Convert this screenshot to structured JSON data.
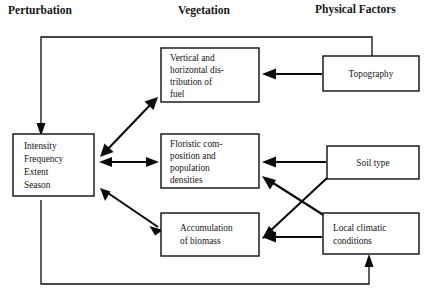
{
  "figure": {
    "type": "conceptual-flow-diagram",
    "title": "",
    "background_color": "#ffffff",
    "line_color": "#0b0b0b"
  },
  "headings": [
    {
      "id": "perturbation",
      "label": "Perturbation",
      "x": 8,
      "y": 14
    },
    {
      "id": "vegetation",
      "label": "Vegetation",
      "x": 178,
      "y": 14
    },
    {
      "id": "physical_factors",
      "label": "Physical Factors",
      "x": 315,
      "y": 13
    }
  ],
  "boxes": [
    {
      "id": "perturbation-box",
      "name": "perturbation-attributes-box",
      "column": "Perturbation",
      "x": 13,
      "y": 134,
      "width": 81,
      "height": 62,
      "align": "left",
      "lines": [
        "Intensity",
        "Frequency",
        "Extent",
        "Season"
      ]
    },
    {
      "id": "fuel-box",
      "name": "fuel-distribution-box",
      "column": "Vegetation",
      "x": 161,
      "y": 48,
      "width": 98,
      "height": 54,
      "align": "left",
      "lines": [
        "Vertical and",
        "horizontal dis-",
        "tribution of",
        "fuel"
      ]
    },
    {
      "id": "floristic-box",
      "name": "floristic-composition-box",
      "column": "Vegetation",
      "x": 161,
      "y": 134,
      "width": 98,
      "height": 54,
      "align": "left",
      "lines": [
        "Floristic com-",
        "position and",
        "population",
        "densities"
      ]
    },
    {
      "id": "biomass-box",
      "name": "biomass-accumulation-box",
      "column": "Vegetation",
      "x": 161,
      "y": 213,
      "width": 98,
      "height": 43,
      "align": "center",
      "lines": [
        "Accumulation",
        "of  biomass"
      ]
    },
    {
      "id": "topography-box",
      "name": "topography-box",
      "column": "Physical Factors",
      "x": 323,
      "y": 56,
      "width": 96,
      "height": 35,
      "align": "center",
      "lines": [
        "Topography"
      ]
    },
    {
      "id": "soiltype-box",
      "name": "soil-type-box",
      "column": "Physical Factors",
      "x": 327,
      "y": 146,
      "width": 92,
      "height": 33,
      "align": "center",
      "lines": [
        "Soil type"
      ]
    },
    {
      "id": "climate-box",
      "name": "local-climatic-conditions-box",
      "column": "Physical Factors",
      "x": 323,
      "y": 213,
      "width": 96,
      "height": 41,
      "align": "left",
      "lines": [
        "Local climatic",
        "conditions"
      ]
    }
  ],
  "connectors": [
    {
      "id": "c1",
      "name": "connector-perturbation-fuel",
      "from": "perturbation-box",
      "to": "fuel-box",
      "kind": "diagonal",
      "arrows": "both",
      "points": "102,155 156,99"
    },
    {
      "id": "c2",
      "name": "connector-perturbation-floristic",
      "from": "perturbation-box",
      "to": "floristic-box",
      "kind": "horizontal",
      "arrows": "both",
      "points": "99,162 158,162"
    },
    {
      "id": "c3",
      "name": "connector-perturbation-biomass",
      "from": "perturbation-box",
      "to": "biomass-box",
      "kind": "diagonal",
      "arrows": "both",
      "points": "101,188 162,229"
    },
    {
      "id": "c4",
      "name": "connector-topography-fuel",
      "from": "topography-box",
      "to": "fuel-box",
      "kind": "horizontal",
      "arrows": "to",
      "points": "322,74 263,74"
    },
    {
      "id": "c5",
      "name": "connector-soiltype-floristic",
      "from": "soiltype-box",
      "to": "floristic-box",
      "kind": "horizontal",
      "arrows": "to",
      "points": "326,162 263,162"
    },
    {
      "id": "c6",
      "name": "connector-soiltype-biomass",
      "from": "soiltype-box",
      "to": "biomass-box",
      "kind": "diagonal",
      "arrows": "to",
      "points": "327,178 262,238"
    },
    {
      "id": "c7",
      "name": "connector-climate-floristic",
      "from": "climate-box",
      "to": "floristic-box",
      "kind": "diagonal",
      "arrows": "to",
      "points": "325,216 263,176"
    },
    {
      "id": "c8",
      "name": "connector-climate-biomass",
      "from": "climate-box",
      "to": "biomass-box",
      "kind": "horizontal",
      "arrows": "to",
      "points": "322,237 263,237"
    },
    {
      "id": "c9",
      "name": "feedback-top-topography-to-perturbation",
      "from": "topography-box",
      "to": "perturbation-box",
      "kind": "orthogonal",
      "arrows": "to",
      "points": "372,56 372,37 41,37 41,130"
    },
    {
      "id": "c10",
      "name": "feedback-bottom-perturbation-to-climate",
      "from": "perturbation-box",
      "to": "climate-box",
      "kind": "orthogonal",
      "arrows": "to",
      "points": "41,200 41,284 369,284 369,258"
    }
  ]
}
